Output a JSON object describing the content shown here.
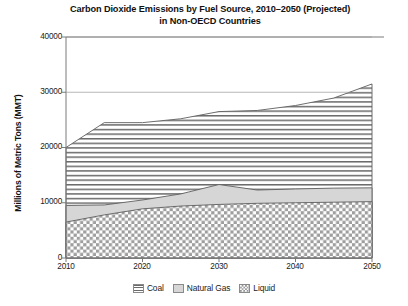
{
  "chart_data": {
    "type": "area",
    "title": "Carbon Dioxide Emissions by Fuel Source, 2010–2050 (Projected)",
    "subtitle": "in Non-OECD Countries",
    "title_line1": "Carbon Dioxide Emissions by Fuel Source, 2010–2050 (Projected)",
    "title_line2": "in Non-OECD Countries",
    "xlabel": "",
    "ylabel": "Millions of Metric Tons (MMT)",
    "stacked": true,
    "grid": false,
    "legend_position": "bottom",
    "xlim": [
      2010,
      2050
    ],
    "ylim": [
      0,
      40000
    ],
    "yticks": [
      "0",
      "10000",
      "20000",
      "30000",
      "40000"
    ],
    "ytick_values": [
      0,
      10000,
      20000,
      30000,
      40000
    ],
    "xticks": [
      "2010",
      "2020",
      "2030",
      "2040",
      "2050"
    ],
    "xtick_values": [
      2010,
      2020,
      2030,
      2040,
      2050
    ],
    "x": [
      2010,
      2015,
      2020,
      2025,
      2030,
      2035,
      2040,
      2045,
      2050
    ],
    "series": [
      {
        "name": "Liquid",
        "pattern": "crosshatch",
        "color": "#b4b4b4",
        "values": [
          6500,
          7800,
          8900,
          9400,
          9700,
          9900,
          10000,
          10100,
          10200
        ]
      },
      {
        "name": "Natural Gas",
        "pattern": "solid-light-gray",
        "color": "#d4d4d4",
        "values": [
          3000,
          1800,
          1600,
          2200,
          3600,
          2400,
          2500,
          2550,
          2500
        ]
      },
      {
        "name": "Coal",
        "pattern": "horizontal-lines",
        "color": "#ffffff",
        "values": [
          10500,
          14900,
          14000,
          13600,
          13200,
          14400,
          15100,
          16300,
          18800
        ]
      }
    ],
    "cumulative_tops": {
      "liquid": [
        6500,
        7800,
        8900,
        9400,
        9700,
        9900,
        10000,
        10100,
        10200
      ],
      "natural_gas": [
        9500,
        9600,
        10500,
        11600,
        13300,
        12300,
        12500,
        12650,
        12700
      ],
      "coal": [
        20000,
        24500,
        24500,
        25200,
        26500,
        26700,
        27600,
        28950,
        31500
      ]
    }
  },
  "legend": {
    "items": [
      {
        "label": "Coal",
        "pattern": "horizontal-lines"
      },
      {
        "label": "Natural Gas",
        "pattern": "solid-light-gray"
      },
      {
        "label": "Liquid",
        "pattern": "crosshatch"
      }
    ]
  },
  "axis": {
    "y_title": "Millions of Metric Tons (MMT)",
    "y_labels": [
      "40000",
      "30000",
      "20000",
      "10000",
      "0"
    ],
    "x_labels": [
      "2010",
      "2020",
      "2030",
      "2040",
      "2050"
    ]
  },
  "colors": {
    "axis": "#6f6f6f",
    "text": "#1a1a1a",
    "gas_fill": "#d4d4d4",
    "liquid_fill": "#b4b4b4",
    "coal_fill": "#ffffff",
    "pattern_stroke": "#5a5a5a"
  }
}
